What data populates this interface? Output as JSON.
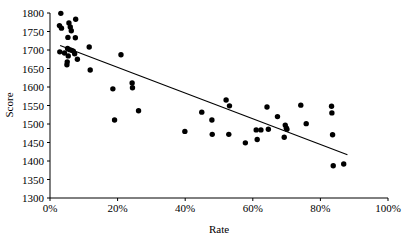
{
  "chart_data": {
    "type": "scatter",
    "title": "",
    "xlabel": "Rate",
    "ylabel": "Score",
    "xlim": [
      0,
      100
    ],
    "ylim": [
      1300,
      1800
    ],
    "grid": false,
    "legend": null,
    "x_tick_labels": [
      "0%",
      "20%",
      "40%",
      "60%",
      "80%",
      "100%"
    ],
    "x_ticks": [
      0,
      20,
      40,
      60,
      80,
      100
    ],
    "y_tick_labels": [
      "1300",
      "1350",
      "1400",
      "1450",
      "1500",
      "1550",
      "1600",
      "1650",
      "1700",
      "1750",
      "1800"
    ],
    "y_ticks": [
      1300,
      1350,
      1400,
      1450,
      1500,
      1550,
      1600,
      1650,
      1700,
      1750,
      1800
    ],
    "marker": "filled-circle",
    "marker_color": "#000000",
    "points": [
      {
        "x": 3.2,
        "y": 1799
      },
      {
        "x": 2.8,
        "y": 1766
      },
      {
        "x": 3.4,
        "y": 1759
      },
      {
        "x": 5.6,
        "y": 1773
      },
      {
        "x": 7.6,
        "y": 1783
      },
      {
        "x": 6.0,
        "y": 1762
      },
      {
        "x": 6.3,
        "y": 1752
      },
      {
        "x": 5.3,
        "y": 1734
      },
      {
        "x": 7.5,
        "y": 1733
      },
      {
        "x": 2.9,
        "y": 1695
      },
      {
        "x": 11.6,
        "y": 1708
      },
      {
        "x": 5.2,
        "y": 1704
      },
      {
        "x": 5.8,
        "y": 1701
      },
      {
        "x": 6.4,
        "y": 1699
      },
      {
        "x": 6.9,
        "y": 1697
      },
      {
        "x": 4.3,
        "y": 1692
      },
      {
        "x": 7.3,
        "y": 1690
      },
      {
        "x": 5.4,
        "y": 1684
      },
      {
        "x": 8.1,
        "y": 1675
      },
      {
        "x": 5.1,
        "y": 1668
      },
      {
        "x": 5.0,
        "y": 1660
      },
      {
        "x": 11.9,
        "y": 1646
      },
      {
        "x": 21.0,
        "y": 1687
      },
      {
        "x": 18.6,
        "y": 1595
      },
      {
        "x": 24.3,
        "y": 1611
      },
      {
        "x": 24.4,
        "y": 1598
      },
      {
        "x": 26.2,
        "y": 1536
      },
      {
        "x": 19.1,
        "y": 1511
      },
      {
        "x": 39.9,
        "y": 1480
      },
      {
        "x": 44.9,
        "y": 1532
      },
      {
        "x": 47.9,
        "y": 1511
      },
      {
        "x": 48.0,
        "y": 1472
      },
      {
        "x": 52.1,
        "y": 1565
      },
      {
        "x": 53.1,
        "y": 1549
      },
      {
        "x": 52.9,
        "y": 1472
      },
      {
        "x": 57.8,
        "y": 1449
      },
      {
        "x": 61.3,
        "y": 1458
      },
      {
        "x": 61.0,
        "y": 1484
      },
      {
        "x": 62.4,
        "y": 1484
      },
      {
        "x": 64.2,
        "y": 1546
      },
      {
        "x": 64.6,
        "y": 1486
      },
      {
        "x": 67.3,
        "y": 1520
      },
      {
        "x": 69.6,
        "y": 1497
      },
      {
        "x": 69.9,
        "y": 1489
      },
      {
        "x": 70.1,
        "y": 1486
      },
      {
        "x": 69.3,
        "y": 1464
      },
      {
        "x": 74.2,
        "y": 1551
      },
      {
        "x": 75.8,
        "y": 1501
      },
      {
        "x": 83.3,
        "y": 1548
      },
      {
        "x": 83.4,
        "y": 1530
      },
      {
        "x": 83.6,
        "y": 1471
      },
      {
        "x": 83.8,
        "y": 1387
      },
      {
        "x": 86.9,
        "y": 1392
      }
    ],
    "trendline": {
      "x_start": 3.0,
      "y_start": 1712,
      "x_end": 88.0,
      "y_end": 1417
    }
  }
}
